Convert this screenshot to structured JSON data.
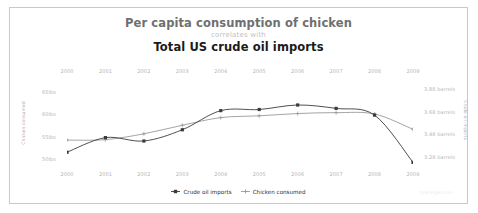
{
  "titles": {
    "top": "Per capita consumption of chicken",
    "connector": "correlates with",
    "bottom": "Total US crude oil imports"
  },
  "watermark": "tylervigen.com",
  "legend": {
    "items": [
      {
        "label": "Crude oil imports",
        "marker": "filled-square",
        "color": "#3b3b3b"
      },
      {
        "label": "Chicken consumed",
        "marker": "plus",
        "color": "#9a9a9a"
      }
    ]
  },
  "chart_data": {
    "type": "line",
    "title": "Per capita consumption of chicken correlates with Total US crude oil imports",
    "xlabel": "",
    "x": [
      "2000",
      "2001",
      "2002",
      "2003",
      "2004",
      "2005",
      "2006",
      "2007",
      "2008",
      "2009"
    ],
    "x_axis_top_labels": [
      "2000",
      "2001",
      "2002",
      "2003",
      "2004",
      "2005",
      "2006",
      "2007",
      "2008",
      "2009"
    ],
    "x_axis_bottom_labels": [
      "2000",
      "2001",
      "2002",
      "2003",
      "2004",
      "2005",
      "2006",
      "2007",
      "2008",
      "2009"
    ],
    "grid": false,
    "legend_position": "bottom",
    "series": [
      {
        "name": "Crude oil imports",
        "axis": "right",
        "ylabel": "Crude oil imports",
        "tick_labels": [
          "3.88 barrels",
          "3.68 barrels",
          "3.48 barrels",
          "3.28 barrels"
        ],
        "ylim": [
          3.18,
          3.98
        ],
        "values": [
          3.32,
          3.45,
          3.42,
          3.52,
          3.69,
          3.7,
          3.74,
          3.71,
          3.65,
          3.23
        ],
        "color": "#3b3b3b",
        "marker": "filled-square"
      },
      {
        "name": "Chicken consumed",
        "axis": "left",
        "ylabel": "Chicken consumed",
        "tick_labels": [
          "65lbs",
          "60lbs",
          "55lbs",
          "50lbs"
        ],
        "ylim": [
          48,
          68
        ],
        "values": [
          54.2,
          54.3,
          55.6,
          57.5,
          59.2,
          59.6,
          60.1,
          60.3,
          60.0,
          56.6
        ],
        "color": "#9a9a9a",
        "marker": "plus"
      }
    ]
  }
}
